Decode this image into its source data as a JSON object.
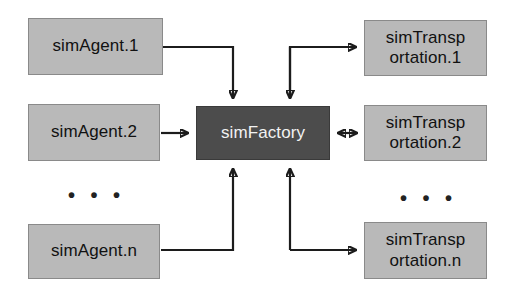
{
  "diagram": {
    "background_color": "#ffffff",
    "node_fill": "#b9b9b9",
    "node_border": "#8a8a8a",
    "hub_fill": "#4c4c4c",
    "edge_color": "#1c1c1c",
    "nodes": [
      {
        "id": "agent1",
        "label": "simAgent.1",
        "x": 28,
        "y": 18,
        "w": 135,
        "h": 57
      },
      {
        "id": "agent2",
        "label": "simAgent.2",
        "x": 28,
        "y": 104,
        "w": 132,
        "h": 57
      },
      {
        "id": "agentn",
        "label": "simAgent.n",
        "x": 28,
        "y": 224,
        "w": 132,
        "h": 55
      },
      {
        "id": "factory",
        "label": "simFactory",
        "x": 196,
        "y": 106,
        "w": 134,
        "h": 54
      },
      {
        "id": "transport1",
        "label": "simTransp\nortation.1",
        "x": 364,
        "y": 20,
        "w": 123,
        "h": 56
      },
      {
        "id": "transport2",
        "label": "simTransp\nortation.2",
        "x": 364,
        "y": 105,
        "w": 123,
        "h": 56
      },
      {
        "id": "transportn",
        "label": "simTransp\nortation.n",
        "x": 364,
        "y": 222,
        "w": 123,
        "h": 57
      }
    ],
    "ellipses": [
      {
        "id": "left-ellipsis",
        "text": "• • •",
        "x": 68,
        "y": 185
      },
      {
        "id": "right-ellipsis",
        "text": "• • •",
        "x": 400,
        "y": 188
      }
    ],
    "edges": [
      {
        "id": "agent1-to-factory",
        "from": "agent1",
        "to": "factory",
        "direction": "one-way",
        "style": "orthogonal"
      },
      {
        "id": "agent2-to-factory",
        "from": "agent2",
        "to": "factory",
        "direction": "one-way",
        "style": "straight"
      },
      {
        "id": "agentn-to-factory",
        "from": "agentn",
        "to": "factory",
        "direction": "one-way",
        "style": "orthogonal"
      },
      {
        "id": "factory-to-transport1",
        "from": "factory",
        "to": "transport1",
        "direction": "one-way",
        "style": "orthogonal"
      },
      {
        "id": "factory-to-transport2",
        "from": "factory",
        "to": "transport2",
        "direction": "two-way",
        "style": "straight"
      },
      {
        "id": "factory-to-transportn",
        "from": "factory",
        "to": "transportn",
        "direction": "one-way",
        "style": "orthogonal"
      }
    ]
  }
}
